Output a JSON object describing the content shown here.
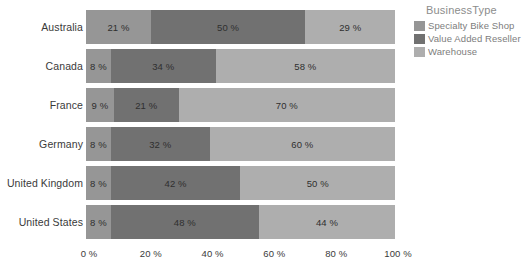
{
  "chart_data": {
    "type": "bar",
    "orientation": "horizontal",
    "stacked": true,
    "normalized_percent": true,
    "title": "",
    "xlabel": "",
    "ylabel": "",
    "xlim": [
      0,
      100
    ],
    "grid": false,
    "legend_position": "right",
    "legend_title": "BusinessType",
    "categories": [
      "Australia",
      "Canada",
      "France",
      "Germany",
      "United Kingdom",
      "United States"
    ],
    "series": [
      {
        "name": "Specialty Bike Shop",
        "color": "#969696",
        "values": [
          21,
          8,
          9,
          8,
          8,
          8
        ],
        "labels": [
          "21 %",
          "8 %",
          "9 %",
          "8 %",
          "8 %",
          "8 %"
        ]
      },
      {
        "name": "Value Added Reseller",
        "color": "#717171",
        "values": [
          50,
          34,
          21,
          32,
          42,
          48
        ],
        "labels": [
          "50 %",
          "34 %",
          "21 %",
          "42 %",
          "42 %",
          "48 %"
        ]
      },
      {
        "name": "Warehouse",
        "color": "#aeaeae",
        "values": [
          29,
          58,
          70,
          60,
          50,
          44
        ],
        "labels": [
          "29 %",
          "58 %",
          "70 %",
          "60 %",
          "50 %",
          "44 %"
        ]
      }
    ],
    "bar_labels": [
      [
        "21 %",
        "50 %",
        "29 %"
      ],
      [
        "8 %",
        "34 %",
        "58 %"
      ],
      [
        "9 %",
        "21 %",
        "70 %"
      ],
      [
        "8 %",
        "32 %",
        "60 %"
      ],
      [
        "8 %",
        "42 %",
        "50 %"
      ],
      [
        "8 %",
        "48 %",
        "44 %"
      ]
    ],
    "xticks": [
      0,
      20,
      40,
      60,
      80,
      100
    ],
    "xtick_labels": [
      "0 %",
      "20 %",
      "40 %",
      "60 %",
      "80 %",
      "100 %"
    ]
  },
  "legend": {
    "title": "BusinessType",
    "items": [
      {
        "label": "Specialty Bike Shop",
        "color": "#969696"
      },
      {
        "label": "Value Added Reseller",
        "color": "#717171"
      },
      {
        "label": "Warehouse",
        "color": "#aeaeae"
      }
    ]
  },
  "colors": {
    "background": "#ffffff",
    "axis_text": "#3a3a3a",
    "legend_text": "#7d7d7d",
    "legend_title": "#8c8c8c",
    "data_label": "#2f2f2f"
  }
}
